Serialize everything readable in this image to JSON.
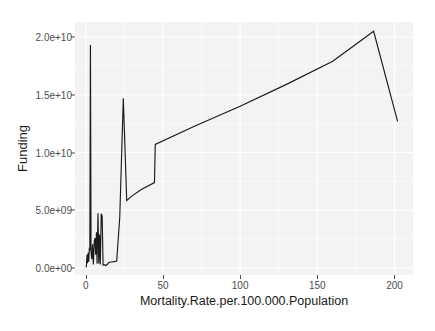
{
  "chart_data": {
    "type": "line",
    "title": "",
    "subtitle": "",
    "xlabel": "Mortality.Rate.per.100.000.Population",
    "ylabel": "Funding",
    "xlim": [
      -7,
      212
    ],
    "ylim": [
      -600000000,
      21300000000
    ],
    "grid": true,
    "legend": null,
    "x_ticks": [
      {
        "value": 0,
        "label": "0"
      },
      {
        "value": 50,
        "label": "50"
      },
      {
        "value": 100,
        "label": "100"
      },
      {
        "value": 150,
        "label": "150"
      },
      {
        "value": 200,
        "label": "200"
      }
    ],
    "y_ticks": [
      {
        "value": 0,
        "label": "0.0e+00"
      },
      {
        "value": 5000000000,
        "label": "5.0e+09"
      },
      {
        "value": 10000000000,
        "label": "1.0e+10"
      },
      {
        "value": 15000000000,
        "label": "1.5e+10"
      },
      {
        "value": 20000000000,
        "label": "2.0e+10"
      }
    ],
    "series": [
      {
        "name": "Funding",
        "color": "#1a1a1a",
        "points": [
          [
            0.3,
            60000000
          ],
          [
            0.8,
            1150000000
          ],
          [
            1.1,
            430000000
          ],
          [
            1.5,
            1320000000
          ],
          [
            1.9,
            560000000
          ],
          [
            2.3,
            1750000000
          ],
          [
            2.6,
            1500000000
          ],
          [
            3.0,
            19300000000
          ],
          [
            3.4,
            1380000000
          ],
          [
            3.9,
            760000000
          ],
          [
            4.4,
            2050000000
          ],
          [
            4.9,
            300000000
          ],
          [
            5.5,
            2350000000
          ],
          [
            6.0,
            2600000000
          ],
          [
            6.4,
            1150000000
          ],
          [
            6.9,
            3100000000
          ],
          [
            7.3,
            380000000
          ],
          [
            7.9,
            4750000000
          ],
          [
            8.4,
            400000000
          ],
          [
            8.9,
            2900000000
          ],
          [
            9.4,
            300000000
          ],
          [
            10.0,
            4700000000
          ],
          [
            10.6,
            4500000000
          ],
          [
            11.2,
            250000000
          ],
          [
            12.0,
            290000000
          ],
          [
            13.0,
            220000000
          ],
          [
            14.0,
            330000000
          ],
          [
            15.0,
            500000000
          ],
          [
            16.5,
            530000000
          ],
          [
            18.5,
            560000000
          ],
          [
            20.0,
            600000000
          ],
          [
            22.0,
            4400000000
          ],
          [
            24.3,
            14700000000
          ],
          [
            26.5,
            5850000000
          ],
          [
            30.0,
            6250000000
          ],
          [
            36.0,
            6800000000
          ],
          [
            44.5,
            7400000000
          ],
          [
            45.0,
            10700000000
          ],
          [
            70.0,
            12250000000
          ],
          [
            100.0,
            14000000000
          ],
          [
            130.0,
            15900000000
          ],
          [
            160.0,
            17900000000
          ],
          [
            186.5,
            20500000000
          ],
          [
            202.0,
            12700000000
          ]
        ]
      }
    ]
  },
  "axes": {
    "y_title": "Funding",
    "x_title": "Mortality.Rate.per.100.000.Population"
  }
}
